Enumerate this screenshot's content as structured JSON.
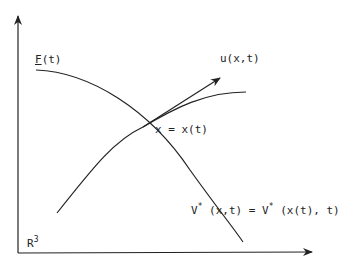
{
  "diagram": {
    "labels": {
      "F": "F",
      "F_arg": "(t)",
      "u": "u(x,t)",
      "x_eq": "x = x(t)",
      "V_lhs": "V",
      "V_lhs_star": "*",
      "V_lhs_arg": " (x,t) = V",
      "V_rhs_star": "*",
      "V_rhs_arg": " (x(t), t)",
      "space": "R",
      "space_exp": "3"
    },
    "colors": {
      "stroke": "#222222",
      "background": "#ffffff"
    }
  }
}
